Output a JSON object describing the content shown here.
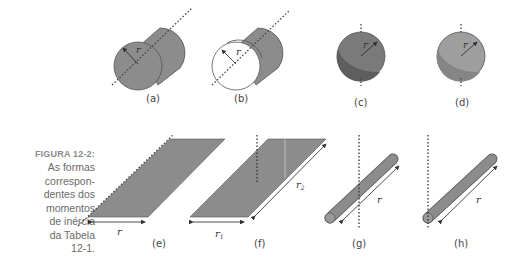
{
  "caption": {
    "label": "FIGURA 12-2:",
    "text_lines": [
      "As formas",
      "correspon-",
      "dentes dos",
      "momentos",
      "de inércia",
      "da Tabela",
      "12-1."
    ]
  },
  "figures": [
    {
      "id": "a",
      "label": "(a)",
      "shape": "solid cylinder",
      "radius_label": "r"
    },
    {
      "id": "b",
      "label": "(b)",
      "shape": "hollow cylinder",
      "radius_label": "r"
    },
    {
      "id": "c",
      "label": "(c)",
      "shape": "solid sphere",
      "radius_label": "r"
    },
    {
      "id": "d",
      "label": "(d)",
      "shape": "hollow sphere",
      "radius_label": "r"
    },
    {
      "id": "e",
      "label": "(e)",
      "shape": "plate about edge",
      "radius_label": "r"
    },
    {
      "id": "f",
      "label": "(f)",
      "shape": "plate about center",
      "radius_label": "r",
      "r1": "r",
      "r1_sub": "1",
      "r2": "r",
      "r2_sub": "2"
    },
    {
      "id": "g",
      "label": "(g)",
      "shape": "rod about center",
      "radius_label": "r"
    },
    {
      "id": "h",
      "label": "(h)",
      "shape": "rod about end",
      "radius_label": "r"
    }
  ],
  "colors": {
    "fill": "#8c8c8c",
    "fill_dark": "#6e6e6e",
    "fill_light": "#9e9e9e",
    "stroke": "#555555",
    "caption": "#6a6a6a"
  }
}
